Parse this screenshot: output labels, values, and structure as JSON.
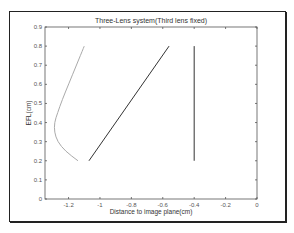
{
  "chart_data": {
    "type": "line",
    "title": "Three-Lens system(Third lens fixed)",
    "xlabel": "Distance to image plane(cm)",
    "ylabel": "EFL(cm)",
    "xlim": [
      -1.35,
      0
    ],
    "ylim": [
      0,
      0.9
    ],
    "xticks": [
      -1.2,
      -1,
      -0.8,
      -0.6,
      -0.4,
      -0.2,
      0
    ],
    "xtick_labels": [
      "-1.2",
      "-1",
      "-0.8",
      "-0.6",
      "-0.4",
      "-0.2",
      "0"
    ],
    "yticks": [
      0,
      0.1,
      0.2,
      0.3,
      0.4,
      0.5,
      0.6,
      0.7,
      0.8,
      0.9
    ],
    "ytick_labels": [
      "0",
      "0.1",
      "0.2",
      "0.3",
      "0.4",
      "0.5",
      "0.6",
      "0.7",
      "0.8",
      "0.9"
    ],
    "grid": false,
    "legend": null,
    "series": [
      {
        "name": "lens-1",
        "color": "#aaaaaa",
        "x": [
          -1.1,
          -1.15,
          -1.2,
          -1.24,
          -1.27,
          -1.29,
          -1.29,
          -1.27,
          -1.22,
          -1.14
        ],
        "y": [
          0.8,
          0.7,
          0.6,
          0.52,
          0.45,
          0.4,
          0.35,
          0.3,
          0.25,
          0.2
        ]
      },
      {
        "name": "lens-2",
        "color": "#333333",
        "x": [
          -1.07,
          -0.56
        ],
        "y": [
          0.2,
          0.8
        ]
      },
      {
        "name": "lens-3",
        "color": "#333333",
        "x": [
          -0.4,
          -0.4
        ],
        "y": [
          0.2,
          0.8
        ]
      }
    ]
  }
}
